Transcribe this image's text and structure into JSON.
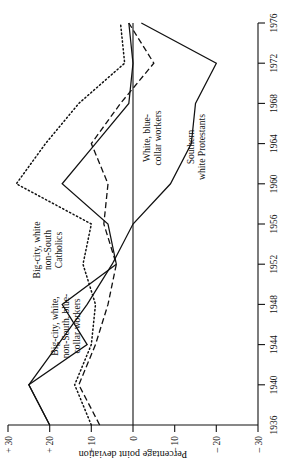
{
  "chart_data": {
    "type": "line",
    "title": "",
    "subtitle": "",
    "xlabel": "",
    "ylabel": "Percentage point deviation",
    "x": [
      1936,
      1940,
      1944,
      1948,
      1952,
      1956,
      1960,
      1964,
      1968,
      1972,
      1976
    ],
    "xticklabels": [
      "1936",
      "1940",
      "1944",
      "1948",
      "1952",
      "1956",
      "1960",
      "1964",
      "1968",
      "1972",
      "1976"
    ],
    "yticklabels": [
      "+ 30",
      "+ 20",
      "+ 10",
      "0",
      "– 10",
      "– 20",
      "– 30"
    ],
    "ytickvalues": [
      30,
      20,
      10,
      0,
      -10,
      -20,
      -30
    ],
    "xlim": [
      1936,
      1976
    ],
    "ylim": [
      -30,
      30
    ],
    "grid": false,
    "legend": "inline-annotations",
    "zero_reference_line": true,
    "series": [
      {
        "name": "Big-city, white, non-South, blue-collar workers",
        "style": "solid",
        "values": [
          20,
          25,
          11,
          17,
          4,
          6,
          17,
          9,
          1,
          0,
          1
        ]
      },
      {
        "name": "Big-city, white non-South Catholics",
        "style": "dotted",
        "values": [
          10,
          14,
          10,
          9,
          12,
          10,
          28,
          21,
          13,
          2,
          3
        ]
      },
      {
        "name": "White, blue-collar workers",
        "style": "dashed",
        "values": [
          8,
          13,
          9,
          6,
          4,
          7,
          6,
          10,
          3,
          -5,
          1
        ]
      },
      {
        "name": "Southern white Protestants",
        "style": "solid",
        "values": [
          20,
          25,
          18,
          11,
          5,
          0,
          -9,
          -14,
          -15,
          -20,
          -2
        ]
      }
    ],
    "annotations": [
      {
        "text_lines": [
          "Big-city, white",
          "non-South",
          "Catholics"
        ],
        "series": "Big-city, white non-South Catholics"
      },
      {
        "text_lines": [
          "Big-city, white,",
          "non-South, blue-",
          "collar workers"
        ],
        "series": "Big-city, white, non-South, blue-collar workers"
      },
      {
        "text_lines": [
          "White, blue-",
          "collar workers"
        ],
        "series": "White, blue-collar workers"
      },
      {
        "text_lines": [
          "Southern",
          "white Protestants"
        ],
        "series": "Southern white Protestants"
      }
    ],
    "colors": {
      "ink": "#111111",
      "background": "#ffffff"
    }
  },
  "axis": {
    "y_title": "Percentage point deviation",
    "yticks": [
      "+ 30",
      "+ 20",
      "+ 10",
      "0",
      "– 10",
      "– 20",
      "– 30"
    ],
    "xticks": [
      "1936",
      "1940",
      "1944",
      "1948",
      "1952",
      "1956",
      "1960",
      "1964",
      "1968",
      "1972",
      "1976"
    ]
  },
  "labels": {
    "catholics_l1": "Big-city, white",
    "catholics_l2": "non-South",
    "catholics_l3": "Catholics",
    "bigcity_l1": "Big-city, white,",
    "bigcity_l2": "non-South, blue-",
    "bigcity_l3": "collar workers",
    "bluecollar_l1": "White, blue-",
    "bluecollar_l2": "collar workers",
    "southern_l1": "Southern",
    "southern_l2": "white Protestants"
  }
}
